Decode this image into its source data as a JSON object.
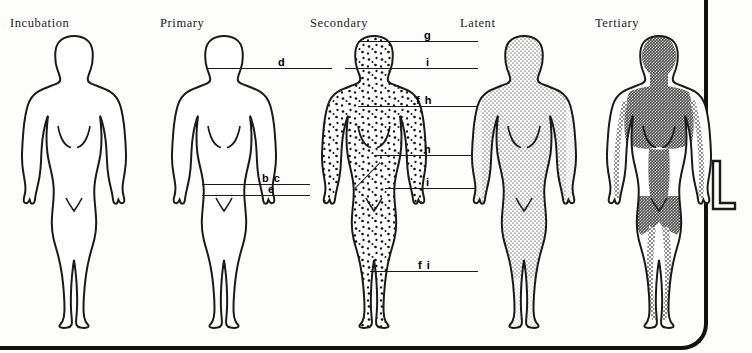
{
  "diagram": {
    "title_font_style": "serif",
    "outline_color": "#1a1a1a",
    "page_background": "#fdfdfc",
    "frame_color": "#111111",
    "margin_glyph": "L"
  },
  "stages": [
    {
      "id": "incubation",
      "label": "Incubation",
      "left": 0,
      "fill": "none",
      "fill_description": "unshaded outline only",
      "callouts": []
    },
    {
      "id": "primary",
      "label": "Primary",
      "left": 150,
      "fill": "none",
      "fill_description": "unshaded outline only",
      "callouts": [
        {
          "letter": "d",
          "line_left": 57,
          "line_top": 68,
          "line_width": 125,
          "letter_left": 128
        },
        {
          "letter": "b c",
          "line_left": 52,
          "line_top": 182,
          "line_width": 108,
          "letter_left": 112
        },
        {
          "letter": "e",
          "line_left": 52,
          "line_top": 192,
          "line_width": 108,
          "letter_left": 118
        }
      ]
    },
    {
      "id": "secondary",
      "label": "Secondary",
      "left": 300,
      "fill": "speckled",
      "fill_description": "dense dot rash over entire body",
      "callouts": [
        {
          "letter": "g",
          "line_left": 58,
          "line_top": 39,
          "line_width": 120,
          "letter_left": 124
        },
        {
          "letter": "i",
          "line_left": 45,
          "line_top": 65,
          "line_width": 133,
          "letter_left": 126
        },
        {
          "letter": "f h",
          "line_left": 58,
          "line_top": 103,
          "line_width": 120,
          "letter_left": 118
        },
        {
          "letter": "h",
          "line_left": 75,
          "line_top": 152,
          "line_width": 103,
          "letter_left": 124
        },
        {
          "letter": "i",
          "line_left": 85,
          "line_top": 185,
          "line_width": 93,
          "letter_left": 126
        },
        {
          "letter": "f i",
          "line_left": 70,
          "line_top": 268,
          "line_width": 108,
          "letter_left": 120
        }
      ]
    },
    {
      "id": "latent",
      "label": "Latent",
      "left": 450,
      "fill": "light-stipple",
      "fill_description": "uniform light halftone shading over whole body",
      "callouts": []
    },
    {
      "id": "tertiary",
      "label": "Tertiary",
      "left": 585,
      "fill": "dark-core",
      "fill_description": "dark halftone over head, torso, pelvis with stippled bands down legs",
      "callouts": []
    }
  ]
}
